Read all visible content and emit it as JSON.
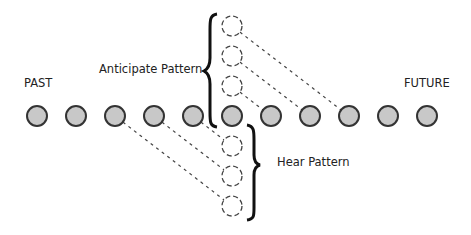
{
  "labels": {
    "past": "PAST",
    "future": "FUTURE",
    "anticipate": "Anticipate Pattern",
    "hear": "Hear Pattern"
  },
  "colors": {
    "circle_fill": "#c8c8c8",
    "circle_stroke": "#333333",
    "dashed_stroke": "#444444",
    "brace": "#111111"
  },
  "timeline": {
    "count": 11,
    "centers_x": [
      37,
      76,
      115,
      154,
      193,
      232,
      271,
      310,
      349,
      388,
      427
    ],
    "y": 116,
    "radius": 10
  },
  "anticipate_pattern": {
    "ghost_centers": [
      [
        232,
        26
      ],
      [
        232,
        56
      ],
      [
        232,
        86
      ]
    ],
    "links": [
      [
        [
          232,
          26
        ],
        [
          349,
          116
        ]
      ],
      [
        [
          232,
          56
        ],
        [
          310,
          116
        ]
      ],
      [
        [
          232,
          86
        ],
        [
          271,
          116
        ]
      ]
    ]
  },
  "hear_pattern": {
    "ghost_centers": [
      [
        232,
        146
      ],
      [
        232,
        176
      ],
      [
        232,
        206
      ]
    ],
    "links": [
      [
        [
          115,
          116
        ],
        [
          232,
          206
        ]
      ],
      [
        [
          154,
          116
        ],
        [
          232,
          176
        ]
      ],
      [
        [
          193,
          116
        ],
        [
          232,
          146
        ]
      ]
    ]
  }
}
